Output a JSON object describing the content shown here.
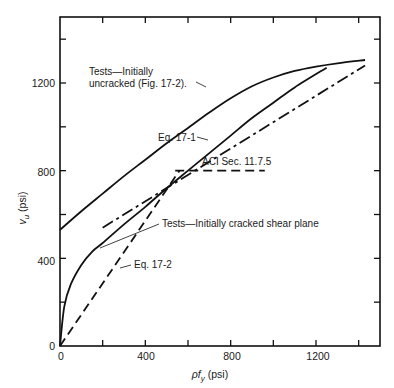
{
  "chart_data": {
    "type": "line",
    "title": "",
    "xlabel": "ρf_y (psi)",
    "ylabel": "v_u (psi)",
    "xlim": [
      0,
      1500
    ],
    "ylim": [
      0,
      1480
    ],
    "x_ticks": [
      0,
      200,
      400,
      600,
      800,
      1000,
      1200,
      1400
    ],
    "x_tick_labels": [
      "0",
      "",
      "400",
      "",
      "800",
      "",
      "1200",
      ""
    ],
    "y_ticks": [
      0,
      200,
      400,
      600,
      800,
      1000,
      1200,
      1400
    ],
    "y_tick_labels": [
      "0",
      "",
      "400",
      "",
      "800",
      "",
      "1200",
      ""
    ],
    "grid": false,
    "legend": "none (inline annotations)",
    "series": [
      {
        "name": "Tests—Initially uncracked (Fig. 17-2).",
        "style": "solid",
        "x": [
          0,
          100,
          200,
          300,
          400,
          500,
          600,
          700,
          800,
          900,
          1000,
          1100,
          1200,
          1300,
          1430
        ],
        "y": [
          530,
          615,
          695,
          775,
          850,
          925,
          995,
          1065,
          1130,
          1185,
          1225,
          1255,
          1275,
          1290,
          1305
        ]
      },
      {
        "name": "Tests—Initially cracked shear plane",
        "style": "solid",
        "x": [
          0,
          20,
          50,
          100,
          150,
          200,
          300,
          400,
          500,
          600,
          700,
          800,
          900,
          1000,
          1100,
          1250
        ],
        "y": [
          0,
          180,
          280,
          370,
          430,
          470,
          555,
          635,
          720,
          800,
          880,
          960,
          1040,
          1110,
          1180,
          1270
        ]
      },
      {
        "name": "Eq. 17-1",
        "style": "dash-dot",
        "x": [
          200,
          1430
        ],
        "y": [
          540,
          1280
        ]
      },
      {
        "name": "Eq. 17-2",
        "style": "dashed",
        "x": [
          0,
          560
        ],
        "y": [
          0,
          800
        ]
      },
      {
        "name": "ACI Sec. 11.7.5",
        "style": "dashed",
        "x": [
          540,
          960
        ],
        "y": [
          800,
          800
        ]
      }
    ],
    "annotations": [
      {
        "text": "Tests—Initially",
        "x": 90,
        "y": 1310
      },
      {
        "text": "uncracked (Fig. 17-2).",
        "x": 90,
        "y": 1220
      },
      {
        "text": "Eq. 17-1",
        "x": 480,
        "y": 920
      },
      {
        "text": "ACI Sec. 11.7.5",
        "x": 670,
        "y": 850
      },
      {
        "text": "Tests—Initially cracked shear plane",
        "x": 500,
        "y": 530
      },
      {
        "text": "Eq. 17-2",
        "x": 350,
        "y": 370
      }
    ]
  },
  "labels": {
    "y_axis_prefix": "v",
    "y_axis_sub": "u",
    "y_axis_suffix": " (psi)",
    "x_axis_prefix": "ρf",
    "x_axis_sub": "y",
    "x_axis_suffix": " (psi)",
    "ann_uncracked_1": "Tests—Initially",
    "ann_uncracked_2": "uncracked (Fig. 17-2).",
    "ann_eq171": "Eq. 17-1",
    "ann_aci": "ACI Sec. 11.7.5",
    "ann_cracked": "Tests—Initially cracked shear plane",
    "ann_eq172": "Eq. 17-2",
    "x_tick_0": "0",
    "x_tick_400": "400",
    "x_tick_800": "800",
    "x_tick_1200": "1200",
    "y_tick_0": "0",
    "y_tick_400": "400",
    "y_tick_800": "800",
    "y_tick_1200": "1200"
  }
}
